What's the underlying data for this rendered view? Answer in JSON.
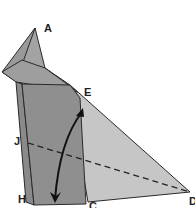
{
  "diagram": {
    "type": "origami-fold-step",
    "labels": {
      "A": "A",
      "E": "E",
      "J": "J",
      "H": "H",
      "C": "C",
      "D": "D"
    },
    "colors": {
      "dark_flap": "#8c8c8c",
      "mid_flap": "#9a9a9a",
      "light_paper": "#c4c4c4",
      "outline": "#2a2a2a",
      "arrow": "#111111",
      "background": "#ffffff"
    },
    "annotations": {
      "fold_line": "dashed valley fold from J to D",
      "arrow": "curved double-headed arrow indicating folding flap down and up"
    }
  }
}
